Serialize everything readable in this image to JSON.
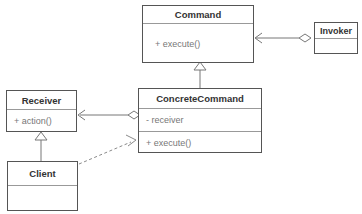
{
  "diagram": {
    "colors": {
      "box_border": "#555555",
      "divider": "#999999",
      "name_text": "#333333",
      "member_text": "#777777",
      "connector": "#777777",
      "background": "#ffffff"
    },
    "classes": [
      {
        "id": "command",
        "name": "Command",
        "compartments": [
          {
            "text": "+ execute()",
            "kind": "operation",
            "visibility": "public"
          }
        ]
      },
      {
        "id": "invoker",
        "name": "Invoker",
        "compartments": [
          {
            "text": "",
            "kind": "attributes",
            "visibility": ""
          }
        ]
      },
      {
        "id": "concretecommand",
        "name": "ConcreteCommand",
        "compartments": [
          {
            "text": "- receiver",
            "kind": "attribute",
            "visibility": "private"
          },
          {
            "text": "+ execute()",
            "kind": "operation",
            "visibility": "public"
          }
        ]
      },
      {
        "id": "receiver",
        "name": "Receiver",
        "compartments": [
          {
            "text": "+ action()",
            "kind": "operation",
            "visibility": "public"
          }
        ]
      },
      {
        "id": "client",
        "name": "Client",
        "compartments": [
          {
            "text": "",
            "kind": "attributes",
            "visibility": ""
          }
        ]
      }
    ],
    "relationships": [
      {
        "id": "invoker-command",
        "type": "aggregation-directed",
        "from": "Invoker",
        "to": "Command",
        "label": "",
        "notation": "hollow diamond at Invoker, open arrowhead at Command"
      },
      {
        "id": "concretecommand-command",
        "type": "generalization",
        "from": "ConcreteCommand",
        "to": "Command",
        "label": "",
        "notation": "hollow triangle arrowhead at Command"
      },
      {
        "id": "concretecommand-receiver",
        "type": "aggregation-directed",
        "from": "ConcreteCommand",
        "to": "Receiver",
        "label": "",
        "notation": "hollow diamond at ConcreteCommand, open arrowhead at Receiver"
      },
      {
        "id": "client-receiver",
        "type": "generalization",
        "from": "Client",
        "to": "Receiver",
        "label": "",
        "notation": "hollow triangle arrowhead at Receiver"
      },
      {
        "id": "client-concretecommand",
        "type": "dependency",
        "from": "Client",
        "to": "ConcreteCommand",
        "label": "",
        "notation": "dashed line with open arrowhead at ConcreteCommand"
      }
    ]
  }
}
